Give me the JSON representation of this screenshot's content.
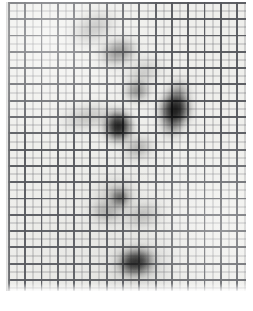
{
  "image": {
    "kind": "scanned-graph-paper-autoradiograph",
    "width_px": 253,
    "height_px": 311,
    "caption": "",
    "paper": {
      "background_color": "#ededea",
      "outer_background_color": "#ffffff",
      "sheet_left_px": 8,
      "sheet_top_px": 2,
      "sheet_width_px": 238,
      "sheet_height_px": 289
    },
    "grid": {
      "coarse_pitch_px": 16.3,
      "coarse_line_width_px": 1.9,
      "coarse_line_color": "#56585d",
      "fine_pitch_px": 8.15,
      "fine_line_width_px": 1,
      "fine_line_color": "#787a7e",
      "coarse_columns": 15,
      "coarse_rows": 18
    },
    "spots": [
      {
        "id": "spot-01",
        "label": "faint upper streak",
        "x": 93,
        "y": 28,
        "rx": 22,
        "ry": 11,
        "rotate_deg": -28,
        "opacity": 0.34,
        "blur_px": 7,
        "color": "#2b2b2b"
      },
      {
        "id": "spot-02",
        "label": "upper dark band",
        "x": 118,
        "y": 52,
        "rx": 17,
        "ry": 10,
        "rotate_deg": -18,
        "opacity": 0.62,
        "blur_px": 6,
        "color": "#1e1e1e"
      },
      {
        "id": "spot-03",
        "label": "upper-right faint streak",
        "x": 143,
        "y": 72,
        "rx": 17,
        "ry": 8,
        "rotate_deg": -30,
        "opacity": 0.3,
        "blur_px": 7,
        "color": "#2b2b2b"
      },
      {
        "id": "spot-04",
        "label": "mid upper spot",
        "x": 137,
        "y": 91,
        "rx": 11,
        "ry": 9,
        "rotate_deg": -10,
        "opacity": 0.52,
        "blur_px": 5,
        "color": "#1a1a1a"
      },
      {
        "id": "spot-05",
        "label": "right dark arrowhead head",
        "x": 175,
        "y": 110,
        "rx": 14,
        "ry": 17,
        "rotate_deg": 12,
        "opacity": 0.94,
        "blur_px": 5,
        "color": "#0a0a0a"
      },
      {
        "id": "spot-06",
        "label": "right dark arrowhead tail",
        "x": 178,
        "y": 93,
        "rx": 7,
        "ry": 12,
        "rotate_deg": 18,
        "opacity": 0.55,
        "blur_px": 6,
        "color": "#151515"
      },
      {
        "id": "spot-07",
        "label": "right arrowhead lower tip",
        "x": 172,
        "y": 127,
        "rx": 7,
        "ry": 9,
        "rotate_deg": 0,
        "opacity": 0.55,
        "blur_px": 6,
        "color": "#151515"
      },
      {
        "id": "spot-08",
        "label": "left horizontal streak",
        "x": 87,
        "y": 117,
        "rx": 24,
        "ry": 7,
        "rotate_deg": -12,
        "opacity": 0.38,
        "blur_px": 7,
        "color": "#2b2b2b"
      },
      {
        "id": "spot-09",
        "label": "central dark spot",
        "x": 118,
        "y": 126,
        "rx": 13,
        "ry": 15,
        "rotate_deg": -8,
        "opacity": 0.93,
        "blur_px": 5,
        "color": "#0a0a0a"
      },
      {
        "id": "spot-10",
        "label": "below-central faint",
        "x": 138,
        "y": 148,
        "rx": 13,
        "ry": 8,
        "rotate_deg": -22,
        "opacity": 0.42,
        "blur_px": 6,
        "color": "#242424"
      },
      {
        "id": "spot-11",
        "label": "small mid dot",
        "x": 120,
        "y": 198,
        "rx": 7,
        "ry": 7,
        "rotate_deg": 0,
        "opacity": 0.88,
        "blur_px": 4,
        "color": "#0d0d0d"
      },
      {
        "id": "spot-12",
        "label": "mid-left halo",
        "x": 116,
        "y": 195,
        "rx": 16,
        "ry": 13,
        "rotate_deg": -15,
        "opacity": 0.3,
        "blur_px": 8,
        "color": "#2b2b2b"
      },
      {
        "id": "spot-13",
        "label": "lower-left streak",
        "x": 106,
        "y": 212,
        "rx": 15,
        "ry": 7,
        "rotate_deg": 10,
        "opacity": 0.42,
        "blur_px": 6,
        "color": "#232323"
      },
      {
        "id": "spot-14",
        "label": "lower-right streak",
        "x": 143,
        "y": 215,
        "rx": 18,
        "ry": 8,
        "rotate_deg": -16,
        "opacity": 0.4,
        "blur_px": 7,
        "color": "#262626"
      },
      {
        "id": "spot-15",
        "label": "bottom dark spot",
        "x": 136,
        "y": 262,
        "rx": 17,
        "ry": 12,
        "rotate_deg": -8,
        "opacity": 0.95,
        "blur_px": 5,
        "color": "#080808"
      },
      {
        "id": "spot-16",
        "label": "bottom spot halo",
        "x": 140,
        "y": 264,
        "rx": 27,
        "ry": 18,
        "rotate_deg": -8,
        "opacity": 0.2,
        "blur_px": 10,
        "color": "#2b2b2b"
      }
    ]
  }
}
